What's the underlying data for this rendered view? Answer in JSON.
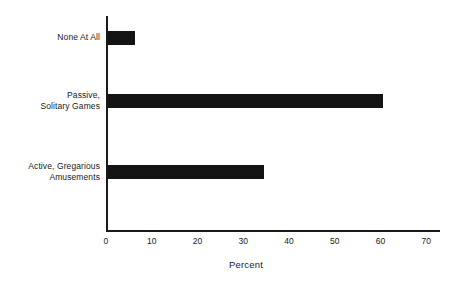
{
  "chart_data": {
    "type": "bar",
    "orientation": "horizontal",
    "title": "",
    "subtitle": "",
    "xlabel": "Percent",
    "ylabel": "",
    "categories": [
      "None At All",
      "Passive,\nSolitary Games",
      "Active, Gregarious\nAmusements"
    ],
    "values": [
      6,
      60,
      34
    ],
    "series": [
      {
        "name": "Percent",
        "values": [
          6,
          60,
          34
        ]
      }
    ],
    "xlim": [
      0,
      73
    ],
    "xticks": [
      0,
      10,
      20,
      30,
      40,
      50,
      60,
      70
    ],
    "xtick_labels": [
      "0",
      "10",
      "20",
      "30",
      "40",
      "50",
      "60",
      "70"
    ],
    "grid": false,
    "legend": false,
    "legend_position": "none",
    "bar_color": "#141414",
    "axis_color": "#1a1a1a",
    "background_color": "#ffffff",
    "annotations": []
  }
}
